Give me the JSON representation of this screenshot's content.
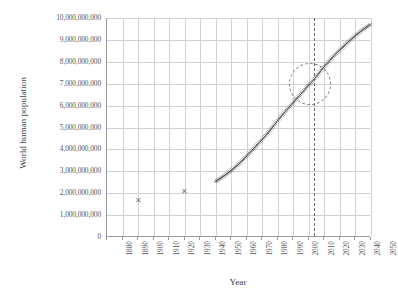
{
  "chart_data": {
    "type": "line",
    "title": "",
    "xlabel": "Year",
    "ylabel": "World human population",
    "xlim": [
      1880,
      2050
    ],
    "ylim": [
      0,
      10000000000
    ],
    "grid": true,
    "legend": "none",
    "x_ticks": [
      "1880",
      "1890",
      "1900",
      "1910",
      "1920",
      "1930",
      "1940",
      "1950",
      "1960",
      "1970",
      "1980",
      "1990",
      "2000",
      "2010",
      "2020",
      "2030",
      "2040",
      "2050"
    ],
    "y_ticks": [
      "0",
      "1,000,000,000",
      "2,000,000,000",
      "3,000,000,000",
      "4,000,000,000",
      "5,000,000,000",
      "6,000,000,000",
      "7,000,000,000",
      "8,000,000,000",
      "9,000,000,000",
      "10,000,000,000"
    ],
    "series": [
      {
        "name": "Historical estimates (scatter)",
        "marker": "x",
        "points": [
          {
            "x": 1900,
            "y": 1650000000
          },
          {
            "x": 1930,
            "y": 2070000000
          }
        ]
      },
      {
        "name": "World population 1950-2050",
        "marker": "x-dense-line",
        "x": [
          1950,
          1955,
          1960,
          1965,
          1970,
          1975,
          1980,
          1985,
          1990,
          1995,
          2000,
          2005,
          2010,
          2011,
          2015,
          2020,
          2025,
          2030,
          2035,
          2040,
          2045,
          2050
        ],
        "values": [
          2536000000,
          2773000000,
          3035000000,
          3340000000,
          3700000000,
          4079000000,
          4458000000,
          4871000000,
          5327000000,
          5744000000,
          6143000000,
          6542000000,
          6957000000,
          7000000000,
          7349000000,
          7795000000,
          8184000000,
          8548000000,
          8888000000,
          9199000000,
          9481000000,
          9725000000
        ]
      }
    ],
    "annotations": [
      {
        "name": "seven-billion-circle",
        "type": "dashed-circle",
        "x": 2011,
        "y": 7000000000,
        "note": "circled 7 billion milestone"
      },
      {
        "name": "present-year-line",
        "type": "dashed-vertical-line",
        "x": 2013
      }
    ]
  },
  "axes": {
    "y_title": "World human population",
    "x_title": "Year"
  },
  "colors": {
    "grid": "#d2d2d2",
    "axis": "#9a9a9a",
    "series": "#4a4a4a",
    "marker": "#7a7a7a",
    "annotation": "#7d7d7d",
    "text": "#555555",
    "background": "#ffffff"
  }
}
